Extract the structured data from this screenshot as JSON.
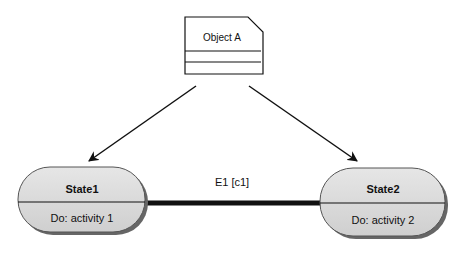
{
  "diagram": {
    "object": {
      "name": "Object A"
    },
    "states": [
      {
        "name": "State1",
        "activity": "Do: activity 1"
      },
      {
        "name": "State2",
        "activity": "Do: activity 2"
      }
    ],
    "transition": {
      "label": "E1 [c1]",
      "from": "State1",
      "to": "State2"
    },
    "colors": {
      "state_fill": "#d9d9d9",
      "line": "#111111",
      "shadow": "#555555"
    }
  }
}
